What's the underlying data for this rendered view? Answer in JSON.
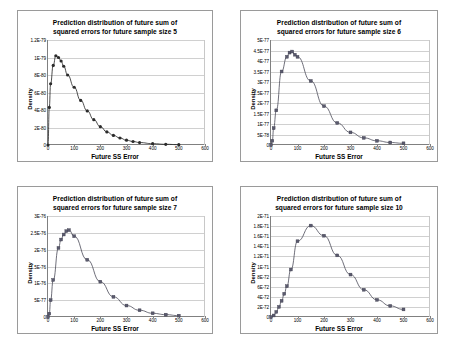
{
  "page": {
    "background": "#ffffff",
    "panel_border_color": "#9a9a9a",
    "grid_color": "#d0d0d0",
    "axis_color": "#808080"
  },
  "chart_data": [
    {
      "id": "chart-size-5",
      "type": "line",
      "title_line1": "Prediction distribution of future sum of",
      "title_line2": "squared errors for future sample size 5",
      "xlabel": "Future SS Error",
      "ylabel": "Density",
      "marker": "diamond",
      "marker_color": "#2b2b2b",
      "line_color": "#1f1f1f",
      "grid": true,
      "legend": "none",
      "xlim": [
        0,
        600
      ],
      "ylim": [
        0,
        1.2e-79
      ],
      "xticks": [
        0,
        100,
        200,
        300,
        400,
        500,
        600
      ],
      "xtick_labels": [
        "0",
        "100",
        "200",
        "300",
        "400",
        "500",
        "600"
      ],
      "yticks": [
        0,
        2e-80,
        4e-80,
        6e-80,
        8e-80,
        1e-79,
        1.2e-79
      ],
      "ytick_labels": [
        "0",
        "2E-80",
        "4E-80",
        "6E-80",
        "8E-80",
        "1E-79",
        "1.2E-79"
      ],
      "x": [
        0,
        5,
        10,
        20,
        30,
        40,
        50,
        60,
        75,
        100,
        125,
        150,
        175,
        200,
        225,
        250,
        275,
        300,
        325,
        350,
        400,
        450,
        500
      ],
      "y": [
        0,
        4.3e-80,
        7e-80,
        9.1e-80,
        1.02e-79,
        1e-79,
        9.6e-80,
        9e-80,
        8e-80,
        6.6e-80,
        5.1e-80,
        3.9e-80,
        2.9e-80,
        2.1e-80,
        1.5e-80,
        1.1e-80,
        8e-81,
        5.5e-81,
        4e-81,
        2.8e-81,
        1.5e-81,
        8e-82,
        4e-82
      ]
    },
    {
      "id": "chart-size-6",
      "type": "line",
      "title_line1": "Prediction distribution of future sum of",
      "title_line2": "squared errors for future sample size 6",
      "xlabel": "Future SS Error",
      "ylabel": "Density",
      "marker": "square",
      "marker_color": "#5a5a6e",
      "line_color": "#4a4a58",
      "grid": true,
      "legend": "none",
      "xlim": [
        0,
        600
      ],
      "ylim": [
        0,
        5e-77
      ],
      "xticks": [
        0,
        100,
        200,
        300,
        400,
        500,
        600
      ],
      "xtick_labels": [
        "0",
        "100",
        "200",
        "300",
        "400",
        "500",
        "600"
      ],
      "yticks": [
        0,
        5e-78,
        1e-77,
        1.5e-77,
        2e-77,
        2.5e-77,
        3e-77,
        3.5e-77,
        4e-77,
        4.5e-77,
        5e-77
      ],
      "ytick_labels": [
        "0",
        "5E-78",
        "1E-77",
        "1.5E-77",
        "2E-77",
        "2.5E-77",
        "3E-77",
        "3.5E-77",
        "4E-77",
        "4.5E-77",
        "5E-77"
      ],
      "x": [
        0,
        5,
        10,
        20,
        40,
        60,
        70,
        80,
        90,
        100,
        150,
        200,
        250,
        300,
        350,
        400,
        450,
        500
      ],
      "y": [
        0,
        2e-78,
        8e-78,
        1.65e-77,
        3.5e-77,
        4.2e-77,
        4.4e-77,
        4.45e-77,
        4.3e-77,
        4.2e-77,
        3.05e-77,
        1.85e-77,
        1.05e-77,
        6e-78,
        3.4e-78,
        2e-78,
        1.2e-78,
        8e-79
      ]
    },
    {
      "id": "chart-size-7",
      "type": "line",
      "title_line1": "Prediction distribution of future sum of",
      "title_line2": "squared errors for future sample size 7",
      "xlabel": "Future SS Error",
      "ylabel": "Density",
      "marker": "square",
      "marker_color": "#5a5a6e",
      "line_color": "#4a4a58",
      "grid": true,
      "legend": "none",
      "xlim": [
        0,
        600
      ],
      "ylim": [
        0,
        3e-76
      ],
      "xticks": [
        0,
        100,
        200,
        300,
        400,
        500,
        600
      ],
      "xtick_labels": [
        "0",
        "100",
        "200",
        "300",
        "400",
        "500",
        "600"
      ],
      "yticks": [
        0,
        5e-77,
        1e-76,
        1.5e-76,
        2e-76,
        2.5e-76,
        3e-76
      ],
      "ytick_labels": [
        "0",
        "5E-77",
        "1E-76",
        "1.5E-76",
        "2E-76",
        "2.5E-76",
        "3E-76"
      ],
      "x": [
        0,
        5,
        10,
        20,
        40,
        50,
        60,
        70,
        80,
        100,
        150,
        200,
        250,
        300,
        350,
        400,
        450,
        500
      ],
      "y": [
        0,
        1e-77,
        5e-77,
        1.1e-76,
        2.05e-76,
        2.3e-76,
        2.45e-76,
        2.55e-76,
        2.58e-76,
        2.4e-76,
        1.7e-76,
        1.05e-76,
        6e-77,
        3.4e-77,
        2e-77,
        1.1e-77,
        7e-78,
        4e-78
      ]
    },
    {
      "id": "chart-size-10",
      "type": "line",
      "title_line1": "Prediction distribution of future sum of",
      "title_line2": "squared errors for future sample size 10",
      "xlabel": "Future SS Error",
      "ylabel": "Density",
      "marker": "square",
      "marker_color": "#5a5a6e",
      "line_color": "#4a4a58",
      "grid": true,
      "legend": "none",
      "xlim": [
        0,
        600
      ],
      "ylim": [
        0,
        2e-71
      ],
      "xticks": [
        0,
        100,
        200,
        300,
        400,
        500,
        600
      ],
      "xtick_labels": [
        "0",
        "100",
        "200",
        "300",
        "400",
        "500",
        "600"
      ],
      "yticks": [
        0,
        2e-72,
        4e-72,
        6e-72,
        8e-72,
        1e-71,
        1.2e-71,
        1.4e-71,
        1.6e-71,
        1.8e-71,
        2e-71
      ],
      "ytick_labels": [
        "0",
        "2E-72",
        "4E-72",
        "6E-72",
        "8E-72",
        "1E-71",
        "1.2E-71",
        "1.4E-71",
        "1.6E-71",
        "1.8E-71",
        "2E-71"
      ],
      "x": [
        0,
        10,
        20,
        30,
        40,
        50,
        60,
        75,
        100,
        150,
        200,
        250,
        300,
        350,
        400,
        450,
        500
      ],
      "y": [
        0,
        3e-73,
        1e-72,
        2e-72,
        3.2e-72,
        4.6e-72,
        6.1e-72,
        9.4e-72,
        1.5e-71,
        1.81e-71,
        1.61e-71,
        1.22e-71,
        8.4e-72,
        5.4e-72,
        3.4e-72,
        2.2e-72,
        1.5e-72
      ]
    }
  ]
}
